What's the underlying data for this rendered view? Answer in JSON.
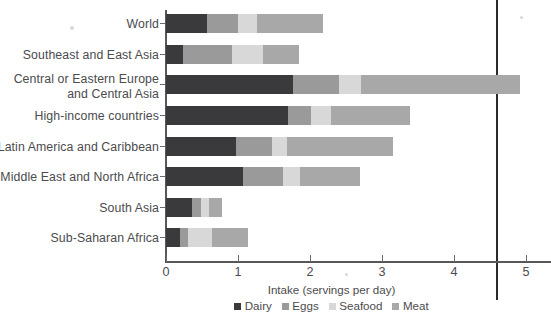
{
  "chart_data": {
    "type": "bar",
    "orientation": "horizontal",
    "stacked": true,
    "title": "",
    "xlabel": "Intake (servings per day)",
    "ylabel": "",
    "xlim": [
      0,
      5.35
    ],
    "xticks": [
      0,
      1,
      2,
      3,
      4,
      5
    ],
    "xtick_labels": [
      "0",
      "1",
      "2",
      "3",
      "4",
      "5"
    ],
    "grid": false,
    "legend_position": "bottom",
    "categories": [
      "World",
      "Southeast and East Asia",
      "Central or Eastern Europe and Central Asia",
      "High-income countries",
      "Latin America and Caribbean",
      "Middle East and North Africa",
      "South Asia",
      "Sub-Saharan Africa"
    ],
    "category_lines": [
      [
        "World"
      ],
      [
        "Southeast and East Asia"
      ],
      [
        "Central or Eastern Europe",
        "and Central Asia"
      ],
      [
        "High-income countries"
      ],
      [
        "Latin America and Caribbean"
      ],
      [
        "Middle East and North Africa"
      ],
      [
        "South Asia"
      ],
      [
        "Sub-Saharan Africa"
      ]
    ],
    "series": [
      {
        "name": "Dairy",
        "color": "#3a3a3c",
        "values": [
          0.57,
          0.24,
          1.76,
          1.69,
          0.97,
          1.07,
          0.36,
          0.19
        ]
      },
      {
        "name": "Eggs",
        "color": "#9a9a9a",
        "values": [
          0.43,
          0.68,
          0.64,
          0.32,
          0.5,
          0.56,
          0.13,
          0.11
        ]
      },
      {
        "name": "Seafood",
        "color": "#d8d8d8",
        "values": [
          0.26,
          0.43,
          0.31,
          0.28,
          0.21,
          0.23,
          0.11,
          0.34
        ]
      },
      {
        "name": "Meat",
        "color": "#a8a8a8",
        "values": [
          0.92,
          0.5,
          2.21,
          1.1,
          1.47,
          0.83,
          0.18,
          0.5
        ]
      }
    ],
    "totals": [
      2.18,
      1.85,
      4.92,
      3.39,
      3.15,
      2.69,
      0.78,
      1.14
    ],
    "cumulative_edges": [
      [
        0.57,
        1.0,
        1.26,
        2.18
      ],
      [
        0.24,
        0.92,
        1.35,
        1.85
      ],
      [
        1.76,
        2.4,
        2.71,
        4.92
      ],
      [
        1.69,
        2.01,
        2.29,
        3.39
      ],
      [
        0.97,
        1.47,
        1.68,
        3.15
      ],
      [
        1.07,
        1.63,
        1.86,
        2.69
      ],
      [
        0.36,
        0.49,
        0.6,
        0.78
      ],
      [
        0.19,
        0.3,
        0.64,
        1.14
      ]
    ]
  },
  "axis": {
    "x_title": "Intake (servings per day)",
    "ticks": [
      "0",
      "1",
      "2",
      "3",
      "4",
      "5"
    ]
  },
  "legend": {
    "items": [
      {
        "label": "Dairy",
        "color": "#3a3a3c"
      },
      {
        "label": "Eggs",
        "color": "#9a9a9a"
      },
      {
        "label": "Seafood",
        "color": "#d8d8d8"
      },
      {
        "label": "Meat",
        "color": "#a8a8a8"
      }
    ]
  },
  "colors": {
    "dairy": "#3a3a3c",
    "eggs": "#9a9a9a",
    "seafood": "#d8d8d8",
    "meat": "#a8a8a8",
    "axis": "#58585a",
    "text": "#4b4b4d",
    "binding_rule": "#2b2b2d",
    "background": "#ffffff"
  }
}
